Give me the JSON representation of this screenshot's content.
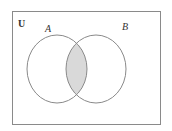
{
  "diagram": {
    "type": "venn",
    "universe_label": "U",
    "sets": [
      {
        "label": "A"
      },
      {
        "label": "B"
      }
    ],
    "shaded_region": "A ∩ B",
    "colors": {
      "stroke": "#8a8a8a",
      "shade": "#d9d9d9",
      "background": "#ffffff"
    }
  }
}
